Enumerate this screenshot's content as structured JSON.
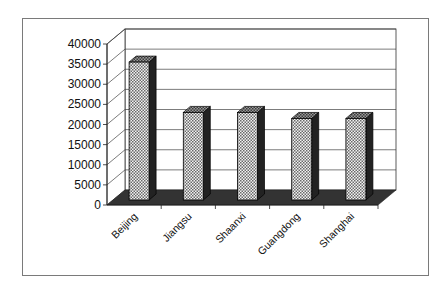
{
  "chart_data": {
    "type": "bar",
    "style": "3d-column",
    "title": "",
    "xlabel": "",
    "ylabel": "",
    "categories": [
      "Beijing",
      "Jiangsu",
      "Shaanxi",
      "Guangdong",
      "Shanghai"
    ],
    "values": [
      36000,
      23500,
      23500,
      22000,
      22000
    ],
    "ylim": [
      0,
      40000
    ],
    "yticks": [
      0,
      5000,
      10000,
      15000,
      20000,
      25000,
      30000,
      35000,
      40000
    ],
    "ytick_labels": [
      "0",
      "5000",
      "10000",
      "15000",
      "20000",
      "25000",
      "30000",
      "35000",
      "40000"
    ],
    "grid": true,
    "legend": null,
    "colors": {
      "bar_fill_pattern": "crosshatch",
      "bar_side": "#2a2a2a",
      "floor": "#333333",
      "gridline": "#555555",
      "frame": "#7a7a7a"
    }
  }
}
